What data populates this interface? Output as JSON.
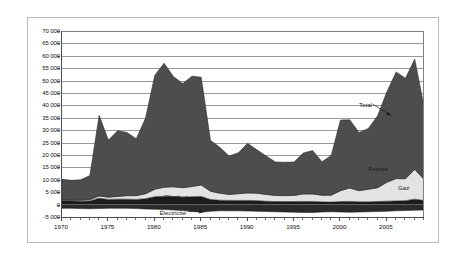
{
  "chart_data": {
    "type": "area",
    "stacked": true,
    "title": "",
    "subtitle": "",
    "xlabel": "",
    "ylabel": "",
    "xlim": [
      1970,
      2009
    ],
    "ylim": [
      -5000,
      70000
    ],
    "ytick_step": 5000,
    "grid": true,
    "legend_position": "inline-annotations",
    "ytick_labels": [
      "70 000",
      "65 000",
      "60 000",
      "55 000",
      "50 000",
      "45 000",
      "40 000",
      "35 000",
      "30 000",
      "25 000",
      "20 000",
      "15 000",
      "10 000",
      "5 000",
      "0",
      "-5 000"
    ],
    "ytick_values": [
      70000,
      65000,
      60000,
      55000,
      50000,
      45000,
      40000,
      35000,
      30000,
      25000,
      20000,
      15000,
      10000,
      5000,
      0,
      -5000
    ],
    "xtick_labels": [
      "1970",
      "1975",
      "1980",
      "1985",
      "1990",
      "1995",
      "2000",
      "2005"
    ],
    "xtick_values": [
      1970,
      1975,
      1980,
      1985,
      1990,
      1995,
      2000,
      2005
    ],
    "x": [
      1970,
      1971,
      1972,
      1973,
      1974,
      1975,
      1976,
      1977,
      1978,
      1979,
      1980,
      1981,
      1982,
      1983,
      1984,
      1985,
      1986,
      1987,
      1988,
      1989,
      1990,
      1991,
      1992,
      1993,
      1994,
      1995,
      1996,
      1997,
      1998,
      1999,
      2000,
      2001,
      2002,
      2003,
      2004,
      2005,
      2006,
      2007,
      2008,
      2009
    ],
    "series": [
      {
        "name": "Électricité",
        "color": "#2b2b2b",
        "note": "plotted below zero (negative band)",
        "values": [
          -1500,
          -1500,
          -1600,
          -1700,
          -1600,
          -1500,
          -1500,
          -1500,
          -1600,
          -1800,
          -1900,
          -2000,
          -2200,
          -2400,
          -2600,
          -3100,
          -2700,
          -2500,
          -2500,
          -2500,
          -2600,
          -2700,
          -2800,
          -2900,
          -3000,
          -3100,
          -3200,
          -3200,
          -3000,
          -2900,
          -3000,
          -3100,
          -3000,
          -2900,
          -2800,
          -2700,
          -2500,
          -2400,
          -2300,
          -2200
        ]
      },
      {
        "name": "Charbon",
        "color": "#1b1b1b",
        "values": [
          1600,
          1500,
          1400,
          1500,
          2600,
          2100,
          2200,
          2200,
          2100,
          2400,
          3200,
          3400,
          3300,
          3000,
          3200,
          3300,
          2100,
          1800,
          1700,
          1700,
          1700,
          1600,
          1400,
          1200,
          1200,
          1200,
          1300,
          1200,
          1100,
          1000,
          1200,
          1300,
          1100,
          1100,
          1200,
          1400,
          1500,
          1600,
          2200,
          1700
        ]
      },
      {
        "name": "Gaz",
        "color": "#e3e3e3",
        "values": [
          300,
          300,
          400,
          500,
          900,
          900,
          1100,
          1400,
          1500,
          2000,
          3000,
          3600,
          3900,
          3800,
          4100,
          4600,
          3300,
          2800,
          2400,
          2700,
          3000,
          3000,
          2700,
          2500,
          2400,
          2500,
          3000,
          3100,
          2700,
          2800,
          4400,
          5400,
          4500,
          5100,
          5600,
          7600,
          9000,
          8800,
          12000,
          8500
        ]
      },
      {
        "name": "Pétrole",
        "color": "#4d4d4d",
        "values": [
          8300,
          8000,
          8200,
          9700,
          32500,
          23000,
          26500,
          25500,
          23000,
          30500,
          46000,
          50000,
          44500,
          42000,
          44500,
          43500,
          20500,
          18500,
          15500,
          16500,
          20000,
          17500,
          15500,
          13500,
          13500,
          13500,
          16500,
          17500,
          13500,
          16000,
          28500,
          27500,
          23500,
          24500,
          29000,
          36500,
          43000,
          40500,
          44500,
          29500
        ]
      }
    ],
    "total_note": "Total = Pétrole + Gaz + Charbon (upper envelope)",
    "annotations": [
      {
        "label": "Total",
        "x": 2002.0,
        "y": 40000,
        "has_leader": true,
        "target_x": 2005.4,
        "target_y": 36000
      },
      {
        "label": "Pétrole",
        "x": 2003.0,
        "y": 14500,
        "has_leader": false
      },
      {
        "label": "Gaz",
        "x": 2006.2,
        "y": 6800,
        "has_leader": false
      },
      {
        "label": "Charbon",
        "x": 1981.0,
        "y": 3200,
        "has_leader": false
      },
      {
        "label": "Électricité",
        "x": 1980.5,
        "y": -3200,
        "has_leader": true,
        "target_x": 1985.2,
        "target_y": -2900
      }
    ]
  }
}
